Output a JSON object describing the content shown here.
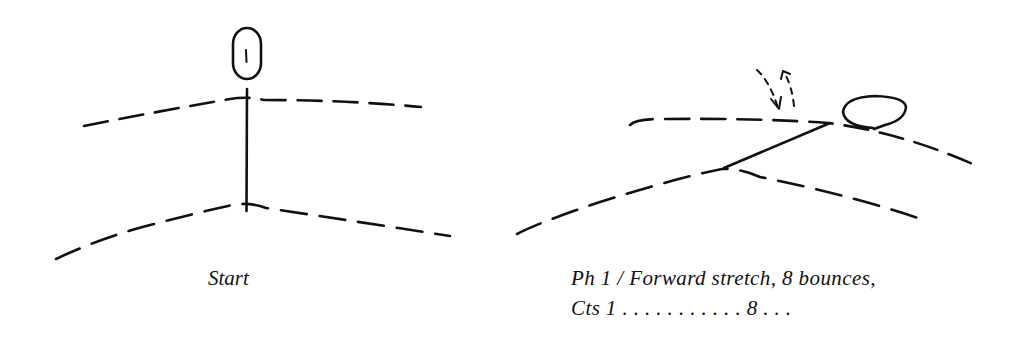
{
  "panels": [
    {
      "id": "start",
      "caption": "Start",
      "figure": {
        "pose": "standing upright",
        "head_label": "1"
      }
    },
    {
      "id": "phase-1",
      "caption_lines": [
        "Ph 1 / Forward stretch, 8 bounces,",
        "Cts 1 . . . . . . . . . . . 8 . . ."
      ],
      "figure": {
        "pose": "forward stretch (leaning forward)",
        "motion_indicator": "dashed down-up bounce arrows"
      }
    }
  ],
  "colors": {
    "ink": "#111111",
    "background": "#ffffff"
  }
}
